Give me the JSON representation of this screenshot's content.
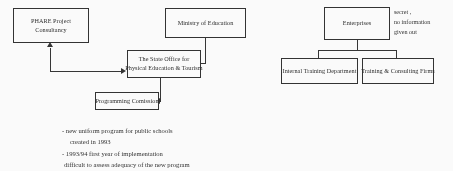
{
  "diagram": {
    "left_cluster": {
      "nodes": [
        {
          "id": "phare",
          "lines": [
            "PHARE Project",
            "Consultancy"
          ]
        },
        {
          "id": "ministry",
          "lines": [
            "Ministry of Education"
          ]
        },
        {
          "id": "state_office",
          "lines": [
            "The State Office for",
            "Physical Education & Tourism"
          ]
        },
        {
          "id": "programming",
          "lines": [
            "Programming Comission"
          ]
        }
      ]
    },
    "right_cluster": {
      "nodes": [
        {
          "id": "enterprises",
          "lines": [
            "Enterprises"
          ]
        },
        {
          "id": "internal_training",
          "lines": [
            "Internal Training Department"
          ]
        },
        {
          "id": "consulting_firms",
          "lines": [
            "Training & Consulting Firms"
          ]
        }
      ],
      "annotation": {
        "lines": [
          "secret ,",
          "no information",
          "given out"
        ]
      }
    },
    "notes": {
      "lines": [
        "- new uniform program for public  schools",
        "created  in  1993",
        "- 1993/94 first year of implementation",
        "difficult to assess adequacy of the new program"
      ]
    },
    "colors": {
      "ink": "#2b2b2b",
      "paper": "#ffffff"
    }
  }
}
